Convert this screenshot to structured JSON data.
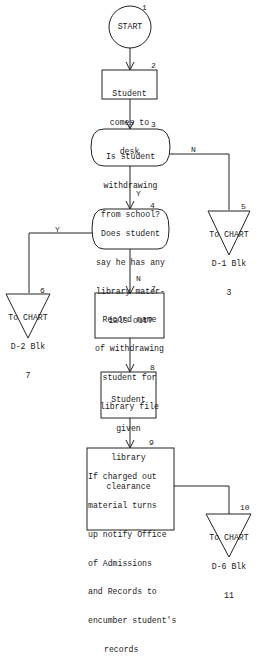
{
  "flowchart": {
    "nodes": [
      {
        "id": "1",
        "shape": "circle",
        "text": "START"
      },
      {
        "id": "2",
        "shape": "process",
        "lines": [
          "Student",
          "comes to",
          "desk"
        ]
      },
      {
        "id": "3",
        "shape": "decision",
        "lines": [
          "Is student",
          "withdrawing",
          "from school?"
        ]
      },
      {
        "id": "4",
        "shape": "decision",
        "lines": [
          "Does student",
          "say he has any",
          "library mater-",
          "ials out?"
        ]
      },
      {
        "id": "5",
        "shape": "offpage-connector",
        "lines": [
          "To CHART",
          "D-1 Blk",
          "3"
        ]
      },
      {
        "id": "6",
        "shape": "offpage-connector",
        "lines": [
          "To CHART",
          "D-2 Blk",
          "7"
        ]
      },
      {
        "id": "7",
        "shape": "process",
        "lines": [
          "Record name",
          "of withdrawing",
          "student for",
          "library file"
        ]
      },
      {
        "id": "8",
        "shape": "process",
        "lines": [
          "Student",
          "given",
          "library",
          "clearance"
        ]
      },
      {
        "id": "9",
        "shape": "process",
        "lines": [
          "If charged out",
          "material turns",
          "up notify Office",
          "of Admissions",
          "and Records to",
          "encumber student's",
          "records"
        ]
      },
      {
        "id": "10",
        "shape": "offpage-connector",
        "lines": [
          "To CHART",
          "D-6 Blk",
          "11"
        ]
      }
    ],
    "edges": [
      {
        "from": "1",
        "to": "2",
        "label": ""
      },
      {
        "from": "2",
        "to": "3",
        "label": ""
      },
      {
        "from": "3",
        "to": "5",
        "label": "N"
      },
      {
        "from": "3",
        "to": "4",
        "label": "Y"
      },
      {
        "from": "4",
        "to": "6",
        "label": "Y"
      },
      {
        "from": "4",
        "to": "7",
        "label": "N"
      },
      {
        "from": "7",
        "to": "8",
        "label": ""
      },
      {
        "from": "8",
        "to": "9",
        "label": ""
      },
      {
        "from": "9",
        "to": "10",
        "label": ""
      }
    ],
    "edge_labels": {
      "n1": "N",
      "y1": "Y",
      "y2": "Y",
      "n2": "N"
    },
    "line_color": "#222222"
  }
}
